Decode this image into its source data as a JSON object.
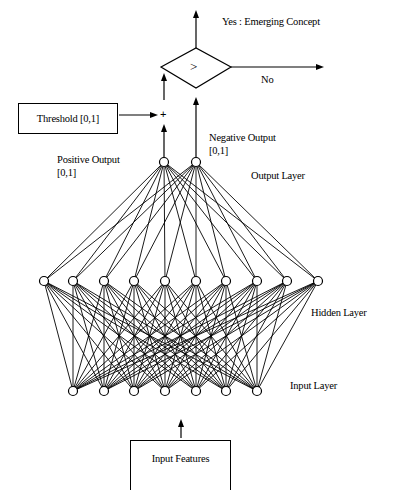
{
  "diagram": {
    "decision": {
      "symbol": ">",
      "yes_label": "Yes : Emerging Concept",
      "no_label": "No"
    },
    "threshold": {
      "label": "Threshold [0,1]",
      "operator": "+"
    },
    "outputs": {
      "positive_label": "Positive Output",
      "positive_range": "[0,1]",
      "negative_label": "Negative Output",
      "negative_range": "[0,1]"
    },
    "layers": {
      "output": {
        "label": "Output Layer",
        "node_count": 2,
        "y": 162,
        "x": [
          164,
          196
        ]
      },
      "hidden": {
        "label": "Hidden Layer",
        "node_count": 10,
        "y": 281,
        "x": [
          44,
          73,
          104,
          134,
          165,
          196,
          226,
          257,
          287,
          318
        ]
      },
      "input": {
        "label": "Input Layer",
        "node_count": 7,
        "y": 391,
        "x": [
          73,
          104,
          134,
          165,
          196,
          226,
          257
        ]
      }
    },
    "input_features": {
      "label": "Input Features"
    },
    "colors": {
      "stroke": "#000000",
      "background": "#ffffff"
    }
  }
}
